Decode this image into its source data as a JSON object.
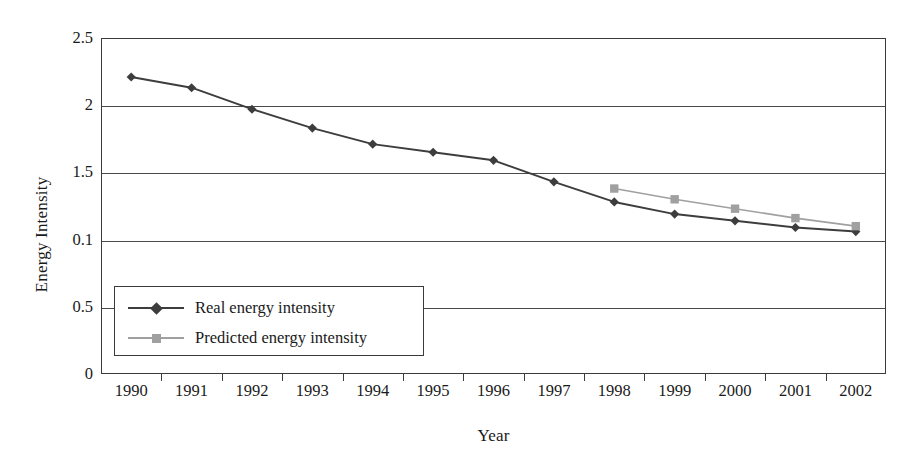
{
  "chart_data": {
    "type": "line",
    "title": "",
    "xlabel": "Year",
    "ylabel": "Energy Intensity",
    "categories": [
      "1990",
      "1991",
      "1992",
      "1993",
      "1994",
      "1995",
      "1996",
      "1997",
      "1998",
      "1999",
      "2000",
      "2001",
      "2002"
    ],
    "ylim": [
      0,
      2.5
    ],
    "ytick_values": [
      2.5,
      2.0,
      1.5,
      1.0,
      0.5,
      0.0
    ],
    "ytick_labels": [
      "2.5",
      "2",
      "1.5",
      "0.1",
      "0.5",
      "0"
    ],
    "grid": "horizontal",
    "legend_position": "lower-left-inside",
    "series": [
      {
        "name": "Real energy intensity",
        "marker": "diamond",
        "color": "#3d3d3d",
        "x": [
          "1990",
          "1991",
          "1992",
          "1993",
          "1994",
          "1995",
          "1996",
          "1997",
          "1998",
          "1999",
          "2000",
          "2001",
          "2002"
        ],
        "values": [
          2.21,
          2.13,
          1.97,
          1.83,
          1.71,
          1.65,
          1.59,
          1.43,
          1.28,
          1.19,
          1.14,
          1.09,
          1.06
        ]
      },
      {
        "name": "Predicted energy intensity",
        "marker": "square",
        "color": "#a0a0a0",
        "x": [
          "1998",
          "1999",
          "2000",
          "2001",
          "2002"
        ],
        "values": [
          1.38,
          1.3,
          1.23,
          1.16,
          1.1
        ]
      }
    ]
  },
  "legend": {
    "items": [
      {
        "label": "Real energy intensity",
        "color": "#3d3d3d",
        "marker": "diamond"
      },
      {
        "label": "Predicted energy intensity",
        "color": "#a0a0a0",
        "marker": "square"
      }
    ]
  },
  "colors": {
    "real_series": "#3d3d3d",
    "predicted_series": "#a0a0a0",
    "axis": "#3b3b3b",
    "gridline": "#4a4a4a",
    "background": "#ffffff"
  }
}
